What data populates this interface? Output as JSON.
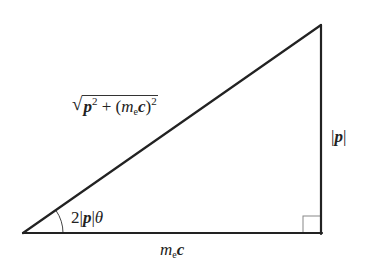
{
  "diagram": {
    "type": "right-triangle",
    "colors": {
      "stroke": "#222222",
      "right_angle_box": "#888888",
      "background": "#ffffff"
    },
    "vertices": {
      "left": [
        23,
        233
      ],
      "top_right": [
        321,
        25
      ],
      "bottom_right": [
        321,
        233
      ]
    },
    "labels": {
      "hypotenuse": {
        "sqrt_symbol": "√",
        "p": "p",
        "p_exp": "2",
        "plus": " + (",
        "m": "m",
        "m_sub": "e",
        "c": "c",
        "close": ")",
        "close_exp": "2"
      },
      "vertical_side": {
        "bar_left": "|",
        "p": "p",
        "bar_right": "|"
      },
      "horizontal_side": {
        "m": "m",
        "m_sub": "e",
        "c": "c"
      },
      "angle": {
        "coef": "2",
        "bar_left": "|",
        "p": "p",
        "bar_right": "|",
        "theta": "θ"
      }
    }
  }
}
